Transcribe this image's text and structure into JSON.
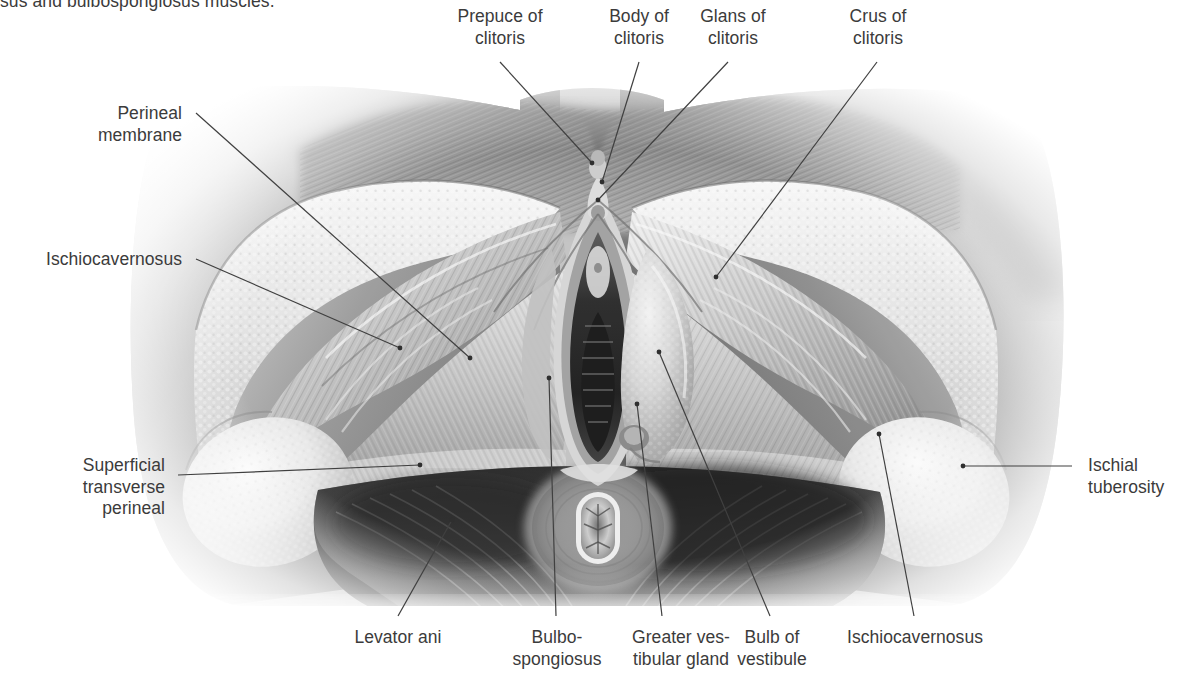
{
  "figure": {
    "caption_fragment": "sus and bulbospongiosus muscles.",
    "illustration_alt": "Grayscale medical illustration of the female superficial perineal muscles and external genitalia, lithotomy view",
    "text_color": "#3b3b3b",
    "leader_color": "#404040",
    "background_color": "#ffffff"
  },
  "labels": {
    "prepuce_of_clitoris": "Prepuce of\nclitoris",
    "body_of_clitoris": "Body of\nclitoris",
    "glans_of_clitoris": "Glans of\nclitoris",
    "crus_of_clitoris": "Crus of\nclitoris",
    "perineal_membrane": "Perineal\nmembrane",
    "ischiocavernosus_left": "Ischiocavernosus",
    "superficial_transverse_perineal": "Superficial\ntransverse\nperineal",
    "ischial_tuberosity": "Ischial\ntuberosity",
    "levator_ani": "Levator ani",
    "bulbospongiosus": "Bulbo-\nspongiosus",
    "greater_vestibular_gland": "Greater ves-\ntibular gland",
    "bulb_of_vestibule": "Bulb of\nvestibule",
    "ischiocavernosus_right": "Ischiocavernosus"
  }
}
